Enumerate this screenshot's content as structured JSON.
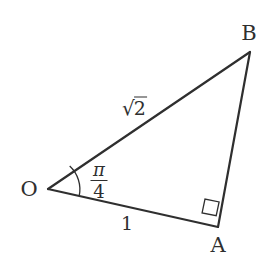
{
  "figure": {
    "kind": "geometry-diagram",
    "background_color": "#ffffff",
    "stroke_color": "#2f2f2f",
    "text_color": "#2f2f2f",
    "stroke_width": 2,
    "width": 275,
    "height": 276,
    "vertices": [
      {
        "name": "O",
        "label": "O",
        "x": 48,
        "y": 189,
        "label_x": 29,
        "label_y": 189
      },
      {
        "name": "A",
        "label": "A",
        "x": 218,
        "y": 227,
        "label_x": 218,
        "label_y": 244
      },
      {
        "name": "B",
        "label": "B",
        "x": 250,
        "y": 52,
        "label_x": 248,
        "label_y": 33
      }
    ],
    "edges": [
      {
        "name": "side-OB",
        "from": "O",
        "to": "B",
        "label": "√2",
        "label_radicand": "2",
        "label_surd": "√",
        "label_x": 134,
        "label_y": 107
      },
      {
        "name": "side-OA",
        "from": "O",
        "to": "A",
        "label": "1",
        "label_x": 127,
        "label_y": 222
      },
      {
        "name": "side-AB",
        "from": "A",
        "to": "B",
        "label": "",
        "label_x": 0,
        "label_y": 0
      }
    ],
    "angles": [
      {
        "name": "angle-at-O",
        "vertex": "O",
        "label_numerator": "π",
        "label_denominator": "4",
        "label_text": "π/4",
        "label_x": 99,
        "label_y": 181,
        "arc_radius": 32,
        "arc_path": "M 78.9 212.3 A 32 32 0 0 1 78.2 165.4"
      },
      {
        "name": "right-angle-at-A",
        "vertex": "A",
        "label_text": "90°",
        "marker": "square",
        "marker_size": 15,
        "marker_path": "M 205.4 211.5 L 203.0 219.0 L 216.2 222.2 L 218.0 214.7 Z"
      }
    ]
  }
}
